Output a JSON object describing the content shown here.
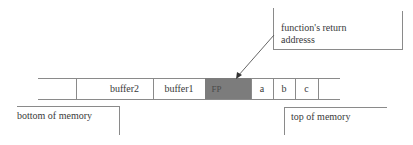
{
  "diagram": {
    "title": "",
    "memory_strip": {
      "cells": [
        {
          "label": "",
          "kind": "empty"
        },
        {
          "label": "buffer2",
          "kind": "buffer"
        },
        {
          "label": "buffer1",
          "kind": "buffer"
        },
        {
          "label": "FP",
          "kind": "frame-pointer"
        },
        {
          "label": "",
          "kind": "return-address"
        },
        {
          "label": "a",
          "kind": "argument"
        },
        {
          "label": "b",
          "kind": "argument"
        },
        {
          "label": "c",
          "kind": "argument"
        },
        {
          "label": "",
          "kind": "empty"
        }
      ],
      "highlight_color": "#7c7c7c"
    },
    "callouts": {
      "return_address": {
        "line1": "function's return",
        "line2": "addresss"
      },
      "bottom": "bottom of memory",
      "top": "top of memory"
    }
  }
}
